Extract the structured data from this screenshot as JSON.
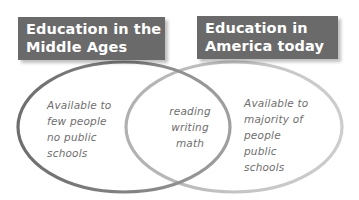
{
  "diagram": {
    "type": "venn",
    "sets": [
      {
        "id": "left",
        "title_lines": [
          "Education in the",
          "Middle Ages"
        ],
        "unique_items": [
          "Available to",
          "few people",
          "no public",
          "schools"
        ],
        "stroke_color": "#7a7a7a"
      },
      {
        "id": "right",
        "title_lines": [
          "Education in",
          "America today"
        ],
        "unique_items": [
          "Available to",
          "majority of",
          "people",
          "public",
          "schools"
        ],
        "stroke_color": "#b8b8b8"
      }
    ],
    "intersection": {
      "items": [
        "reading",
        "writing",
        "math"
      ]
    },
    "colors": {
      "title_box_bg": "#6a6a6a",
      "title_text": "#ffffff",
      "body_text": "#6e6e6e",
      "background": "#ffffff"
    }
  }
}
